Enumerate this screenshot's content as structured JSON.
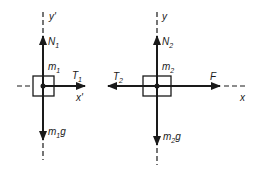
{
  "diagram": {
    "ink_color": "#1a1a1a",
    "left": {
      "mass_label": "m",
      "mass_sub": "1",
      "axis_y_label": "y'",
      "axis_x_label": "x'",
      "normal_force": {
        "sym": "N",
        "sub": "1"
      },
      "tension": {
        "sym": "T",
        "sub": "1"
      },
      "weight": {
        "pre": "m",
        "sub": "1",
        "post": "g"
      }
    },
    "right": {
      "mass_label": "m",
      "mass_sub": "2",
      "axis_y_label": "y",
      "axis_x_label": "x",
      "normal_force": {
        "sym": "N",
        "sub": "2"
      },
      "tension": {
        "sym": "T",
        "sub": "2"
      },
      "applied_force": {
        "sym": "F"
      },
      "weight": {
        "pre": "m",
        "sub": "2",
        "post": "g"
      }
    }
  }
}
